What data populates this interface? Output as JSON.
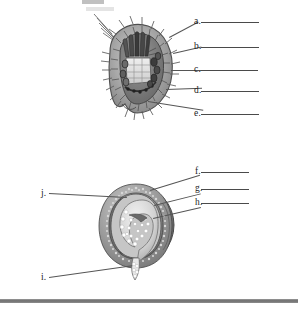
{
  "page": {
    "background_color": "#ffffff",
    "ink_color": "#1d1d1d",
    "rule_color": "#7a7a7a"
  },
  "figures": [
    {
      "id": "figure-top",
      "name": "spiny-organism-cross-section",
      "description": "Cut-away lateral view of a spiny bryozoan-like organism showing tentacle crown, gut and body wall spines",
      "labels": [
        "a.",
        "b.",
        "c.",
        "d.",
        "e."
      ]
    },
    {
      "id": "figure-bottom",
      "name": "spherical-embryo-cross-section",
      "description": "Cut-away of a spherical statoblast/cyst showing inner embryo mass, float ring and attachment stalk",
      "labels": [
        "f.",
        "g.",
        "h.",
        "i.",
        "j."
      ]
    }
  ],
  "labels": {
    "right_upper": [
      {
        "key": "a",
        "text": "a.",
        "answer": ""
      },
      {
        "key": "b",
        "text": "b.",
        "answer": ""
      },
      {
        "key": "c",
        "text": "c.",
        "answer": ""
      },
      {
        "key": "d",
        "text": "d.",
        "answer": ""
      },
      {
        "key": "e",
        "text": "e.",
        "answer": ""
      }
    ],
    "right_lower": [
      {
        "key": "f",
        "text": "f.",
        "answer": ""
      },
      {
        "key": "g",
        "text": "g.",
        "answer": ""
      },
      {
        "key": "h",
        "text": "h.",
        "answer": ""
      }
    ],
    "left_lower": [
      {
        "key": "j",
        "text": "j.",
        "answer": ""
      },
      {
        "key": "i",
        "text": "i.",
        "answer": ""
      }
    ]
  }
}
